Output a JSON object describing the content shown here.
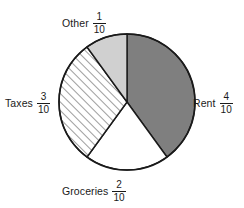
{
  "chart_data": {
    "type": "pie",
    "title": "",
    "subtitle": "",
    "xlabel": "",
    "ylabel": "",
    "legend_position": "inline-callout-labels",
    "grid": false,
    "total_parts": 10,
    "denominator": 10,
    "start_angle_deg": 0,
    "direction": "clockwise",
    "categories": [
      "Rent",
      "Groceries",
      "Taxes",
      "Other"
    ],
    "values": [
      4,
      2,
      3,
      1
    ],
    "fractions": [
      "4/10",
      "2/10",
      "3/10",
      "1/10"
    ],
    "angles_deg": [
      144,
      72,
      108,
      36
    ],
    "slices": [
      {
        "label": "Rent",
        "numerator": "4",
        "denominator": "10",
        "value": 4,
        "angle_deg": 144,
        "start_deg": 0,
        "end_deg": 144,
        "fill": "#7f7f7f",
        "pattern": "solid",
        "label_position": "right"
      },
      {
        "label": "Groceries",
        "numerator": "2",
        "denominator": "10",
        "value": 2,
        "angle_deg": 72,
        "start_deg": 144,
        "end_deg": 216,
        "fill": "#ffffff",
        "pattern": "solid",
        "label_position": "bottom"
      },
      {
        "label": "Taxes",
        "numerator": "3",
        "denominator": "10",
        "value": 3,
        "angle_deg": 108,
        "start_deg": 216,
        "end_deg": 324,
        "fill": "#ffffff",
        "pattern": "diagonal-hatch",
        "label_position": "left"
      },
      {
        "label": "Other",
        "numerator": "1",
        "denominator": "10",
        "value": 1,
        "angle_deg": 36,
        "start_deg": 324,
        "end_deg": 360,
        "fill": "#d0d0d0",
        "pattern": "solid",
        "label_position": "top"
      }
    ]
  },
  "colors": {
    "rent_fill": "#7f7f7f",
    "groceries_fill": "#ffffff",
    "taxes_fill": "#ffffff",
    "taxes_hatch": "#4d4d4d",
    "other_fill": "#d0d0d0",
    "outline": "#1a1a1a",
    "background": "#ffffff",
    "text": "#1a1a1a"
  },
  "geometry": {
    "center_x": 127,
    "center_y": 102,
    "radius": 68
  }
}
